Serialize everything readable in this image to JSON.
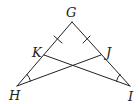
{
  "diagram": {
    "type": "geometry-triangle",
    "colors": {
      "stroke": "#222222",
      "background": "#ffffff"
    },
    "points": {
      "G": {
        "label": "G",
        "x": 72,
        "y": 22
      },
      "H": {
        "label": "H",
        "x": 17,
        "y": 86
      },
      "I": {
        "label": "I",
        "x": 130,
        "y": 86
      },
      "K": {
        "label": "K",
        "x": 44,
        "y": 55
      },
      "J": {
        "label": "J",
        "x": 101,
        "y": 55
      }
    },
    "segments": [
      "GH",
      "GI",
      "HJ",
      "IK"
    ],
    "congruent_segments": [
      "GK",
      "GJ"
    ],
    "congruent_angles": [
      "angle KHJ",
      "angle JIK"
    ]
  }
}
